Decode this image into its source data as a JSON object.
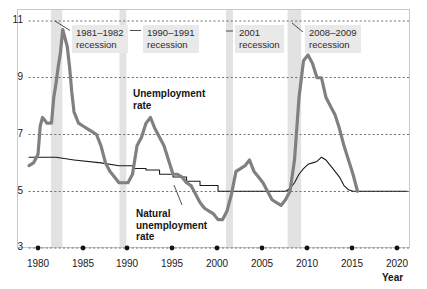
{
  "chart_data": {
    "type": "line",
    "title": "",
    "xlabel": "Year",
    "ylabel": "",
    "xlim": [
      1979,
      2021
    ],
    "ylim": [
      3,
      11
    ],
    "grid": "horizontal dotted gridlines at 3, 5, 7, 9, 11",
    "legend": "inline labels",
    "x_tick_labels": [
      "1980",
      "1985",
      "1990",
      "1995",
      "2000",
      "2005",
      "2010",
      "2015",
      "2020"
    ],
    "x_ticks": [
      1980,
      1985,
      1990,
      1995,
      2000,
      2005,
      2010,
      2015,
      2020
    ],
    "y_tick_labels": [
      "11",
      "9",
      "7",
      "5",
      "3"
    ],
    "y_ticks": [
      11,
      9,
      7,
      5,
      3
    ],
    "series": [
      {
        "name": "Unemployment rate",
        "color": "#808080",
        "width": 3.2,
        "x": [
          1979.0,
          1979.5,
          1980.0,
          1980.25,
          1980.5,
          1980.75,
          1981.0,
          1981.25,
          1981.5,
          1981.75,
          1982.0,
          1982.25,
          1982.5,
          1982.75,
          1983.0,
          1983.25,
          1983.5,
          1983.75,
          1984.0,
          1984.5,
          1985.0,
          1985.5,
          1986.0,
          1986.5,
          1987.0,
          1987.5,
          1988.0,
          1988.5,
          1989.0,
          1989.5,
          1990.0,
          1990.5,
          1991.0,
          1991.5,
          1992.0,
          1992.5,
          1993.0,
          1993.5,
          1994.0,
          1994.5,
          1995.0,
          1995.5,
          1996.0,
          1996.5,
          1997.0,
          1997.5,
          1998.0,
          1998.5,
          1999.0,
          1999.5,
          2000.0,
          2000.5,
          2001.0,
          2001.5,
          2002.0,
          2002.5,
          2003.0,
          2003.5,
          2004.0,
          2004.5,
          2005.0,
          2005.5,
          2006.0,
          2006.5,
          2007.0,
          2007.5,
          2008.0,
          2008.5,
          2009.0,
          2009.5,
          2010.0,
          2010.5,
          2011.0,
          2011.5,
          2012.0,
          2012.5,
          2013.0,
          2013.5,
          2014.0,
          2014.5,
          2015.0,
          2015.5
        ],
        "y": [
          5.9,
          6.0,
          6.3,
          7.3,
          7.6,
          7.5,
          7.4,
          7.4,
          7.4,
          8.3,
          8.8,
          9.4,
          9.9,
          10.7,
          10.4,
          10.1,
          9.4,
          8.5,
          7.8,
          7.4,
          7.3,
          7.2,
          7.1,
          7.0,
          6.6,
          6.0,
          5.7,
          5.5,
          5.3,
          5.3,
          5.3,
          5.6,
          6.6,
          6.9,
          7.4,
          7.6,
          7.2,
          6.9,
          6.6,
          6.1,
          5.6,
          5.6,
          5.5,
          5.3,
          5.2,
          4.9,
          4.6,
          4.4,
          4.3,
          4.2,
          4.0,
          4.0,
          4.3,
          4.9,
          5.7,
          5.8,
          5.9,
          6.1,
          5.7,
          5.5,
          5.3,
          5.0,
          4.7,
          4.6,
          4.5,
          4.7,
          5.0,
          6.1,
          8.3,
          9.6,
          9.8,
          9.5,
          9.0,
          9.0,
          8.3,
          8.0,
          7.7,
          7.2,
          6.6,
          6.1,
          5.6,
          5.0
        ]
      },
      {
        "name": "Natural unemployment rate",
        "color": "#1a1a1a",
        "width": 1.1,
        "x": [
          1979.0,
          1982.0,
          1982.01,
          1984.0,
          1984.01,
          1987.0,
          1987.01,
          1989.0,
          1989.01,
          1990.5,
          1990.51,
          1992.0,
          1992.01,
          1993.5,
          1993.51,
          1995.0,
          1995.01,
          1996.5,
          1996.51,
          1998.0,
          1998.01,
          2000.0,
          2000.01,
          2003.0,
          2003.01,
          2005.0,
          2005.01,
          2007.5,
          2008.0,
          2008.5,
          2009.0,
          2009.5,
          2010.0,
          2010.5,
          2011.0,
          2011.5,
          2012.0,
          2012.5,
          2013.0,
          2013.5,
          2014.0,
          2014.5,
          2015.0,
          2015.5,
          2021.0
        ],
        "y": [
          6.2,
          6.2,
          6.2,
          6.1,
          6.1,
          6.0,
          6.0,
          5.9,
          5.9,
          5.9,
          5.8,
          5.8,
          5.75,
          5.75,
          5.6,
          5.6,
          5.5,
          5.5,
          5.35,
          5.35,
          5.2,
          5.2,
          5.0,
          5.0,
          5.0,
          5.0,
          5.0,
          5.0,
          5.1,
          5.3,
          5.6,
          5.8,
          5.95,
          6.0,
          6.05,
          6.2,
          6.1,
          5.9,
          5.7,
          5.5,
          5.2,
          5.05,
          5.0,
          5.0,
          5.0
        ]
      }
    ],
    "recession_bands": [
      {
        "label": "1981–1982\nrecession",
        "start": 1981.45,
        "end": 1982.7,
        "color": "#e2e2e2"
      },
      {
        "label": "1990–1991\nrecession",
        "start": 1990.5,
        "end": 1991.25,
        "color": "#e2e2e2"
      },
      {
        "label": "2001\nrecession",
        "start": 2001.2,
        "end": 2001.95,
        "color": "#e2e2e2"
      },
      {
        "label": "2008–2009\nrecession",
        "start": 2007.9,
        "end": 2009.4,
        "color": "#e2e2e2"
      }
    ]
  },
  "annotations": [
    {
      "id": "recession-1981-1982",
      "line1": "1981–1982",
      "line2": "recession"
    },
    {
      "id": "recession-1990-1991",
      "line1": "1990–1991",
      "line2": "recession"
    },
    {
      "id": "recession-2001",
      "line1": "2001",
      "line2": "recession"
    },
    {
      "id": "recession-2008-2009",
      "line1": "2008–2009",
      "line2": "recession"
    }
  ],
  "series_labels": {
    "unemployment": "Unemployment\nrate",
    "unemployment_line1": "Unemployment",
    "unemployment_line2": "rate",
    "natural_line1": "Natural",
    "natural_line2": "unemployment",
    "natural_line3": "rate"
  },
  "axes": {
    "y_labels": [
      "11",
      "9",
      "7",
      "5",
      "3"
    ],
    "x_labels": [
      "1980",
      "1985",
      "1990",
      "1995",
      "2000",
      "2005",
      "2010",
      "2015",
      "2020"
    ],
    "x_axis_title": "Year"
  },
  "colors": {
    "unemployment_line": "#808080",
    "natural_line": "#1a1a1a",
    "recession_band": "#e2e2e2",
    "annotation_bg": "#e9e9e9",
    "gridline": "#8f8f8f",
    "frame": "#c9c9c9"
  }
}
